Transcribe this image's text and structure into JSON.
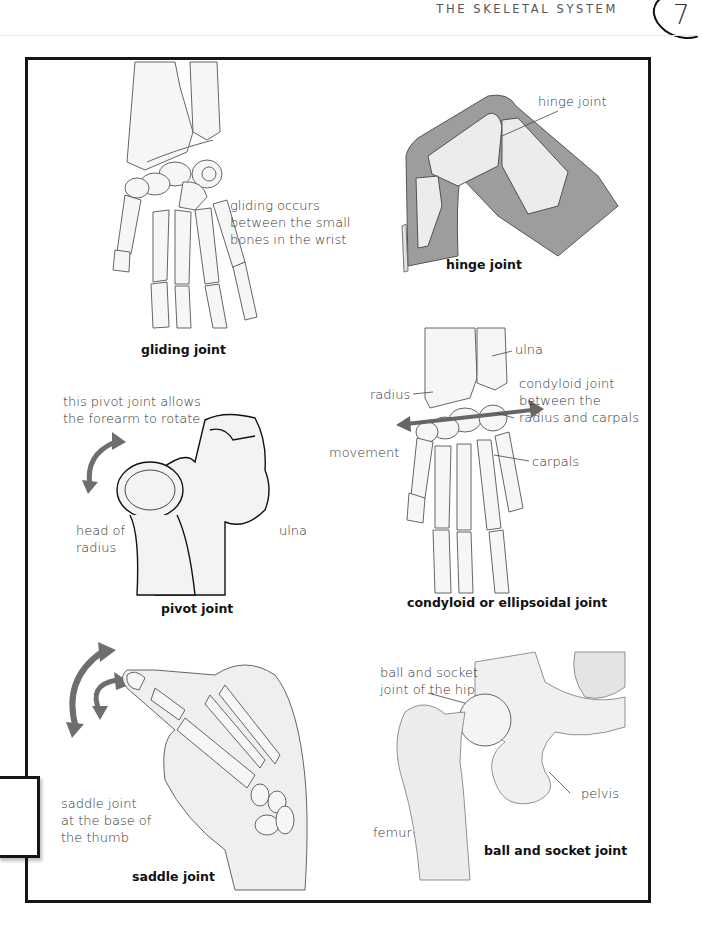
{
  "header": {
    "running_head": "THE SKELETAL SYSTEM",
    "page_number": "7"
  },
  "panels": {
    "gliding": {
      "caption": "gliding joint",
      "annotation": "gliding occurs between the small bones in the wrist",
      "annotation_lines": [
        "gliding occurs",
        "between the small",
        "bones in the wrist"
      ]
    },
    "hinge": {
      "caption": "hinge joint",
      "labels": {
        "joint": "hinge joint"
      }
    },
    "pivot": {
      "caption": "pivot joint",
      "annotation_lines": [
        "this pivot joint allows",
        "the forearm to rotate"
      ],
      "labels": {
        "head_of_radius_lines": [
          "head of",
          "radius"
        ],
        "ulna": "ulna"
      }
    },
    "condyloid": {
      "caption": "condyloid or ellipsoidal joint",
      "labels": {
        "ulna": "ulna",
        "radius": "radius",
        "joint_lines": [
          "condyloid joint",
          "between the",
          "radius and carpals"
        ],
        "movement": "movement",
        "carpals": "carpals"
      }
    },
    "saddle": {
      "caption": "saddle joint",
      "annotation_lines": [
        "saddle joint",
        "at the base of",
        "the thumb"
      ]
    },
    "ball_socket": {
      "caption": "ball and socket joint",
      "labels": {
        "joint_lines": [
          "ball and socket",
          "joint of the hip"
        ],
        "pelvis": "pelvis",
        "femur": "femur"
      }
    }
  },
  "colors": {
    "frame": "#161616",
    "arrow": "#6e6e6e",
    "skin_shade": "#9a9a9a",
    "bone_fill": "#f6f6f6"
  }
}
